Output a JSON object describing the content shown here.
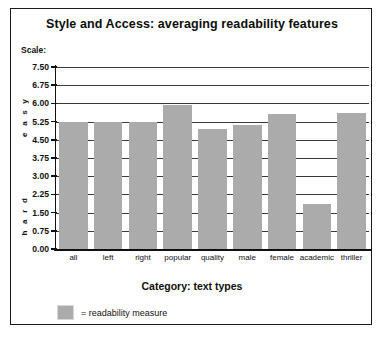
{
  "chart_data": {
    "type": "bar",
    "title": "Style and Access: averaging readability features",
    "xlabel": "Category: text types",
    "ylabel": "Scale:",
    "axis_annotations": {
      "top": "e a s y",
      "bottom": "h a r d"
    },
    "categories": [
      "all",
      "left",
      "right",
      "popular",
      "quality",
      "male",
      "female",
      "academic",
      "thriller"
    ],
    "values": [
      5.25,
      5.25,
      5.25,
      5.95,
      4.95,
      5.1,
      5.55,
      1.85,
      5.6
    ],
    "series": [
      {
        "name": "= readability measure",
        "values": [
          5.25,
          5.25,
          5.25,
          5.95,
          4.95,
          5.1,
          5.55,
          1.85,
          5.6
        ]
      }
    ],
    "ylim": [
      0.0,
      7.5
    ],
    "ytick_step": 0.75,
    "ytick_labels": [
      "7.50",
      "6.75",
      "6.00",
      "5.25",
      "4.50",
      "3.75",
      "3.00",
      "2.25",
      "1.50",
      "0.75",
      "0.00"
    ],
    "ytick_values": [
      7.5,
      6.75,
      6.0,
      5.25,
      4.5,
      3.75,
      3.0,
      2.25,
      1.5,
      0.75,
      0.0
    ],
    "grid": true,
    "legend_position": "bottom-left",
    "bar_color": "#ababab"
  },
  "legend": {
    "label": "= readability measure"
  }
}
